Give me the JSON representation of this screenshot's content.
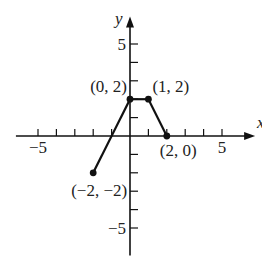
{
  "chart_data": {
    "type": "line",
    "title": "",
    "xlabel": "x",
    "ylabel": "y",
    "xlim": [
      -6.2,
      6.8
    ],
    "ylim": [
      -6.5,
      6.5
    ],
    "x_ticks": [
      -5,
      -4,
      -3,
      -2,
      -1,
      1,
      2,
      3,
      4,
      5
    ],
    "y_ticks": [
      -5,
      -4,
      -3,
      -2,
      -1,
      1,
      2,
      3,
      4,
      5
    ],
    "x_tick_labels": [
      {
        "value": -5,
        "text": "−5"
      },
      {
        "value": 5,
        "text": "5"
      }
    ],
    "y_tick_labels": [
      {
        "value": 5,
        "text": "5"
      },
      {
        "value": -5,
        "text": "−5"
      }
    ],
    "grid": false,
    "series": [
      {
        "name": "piecewise",
        "points": [
          {
            "x": -2,
            "y": -2,
            "label": "(−2, −2)",
            "label_pos": "below-left"
          },
          {
            "x": 0,
            "y": 2,
            "label": "(0, 2)",
            "label_pos": "above-left"
          },
          {
            "x": 1,
            "y": 2,
            "label": "(1, 2)",
            "label_pos": "above-right"
          },
          {
            "x": 2,
            "y": 0,
            "label": "(2, 0)",
            "label_pos": "below-right"
          }
        ]
      }
    ]
  }
}
